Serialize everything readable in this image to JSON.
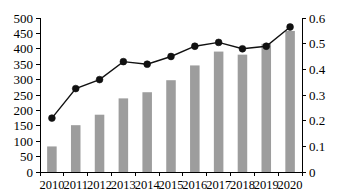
{
  "chart_data": {
    "type": "bar",
    "title": "",
    "subtitle": "",
    "xlabel": "",
    "ylabel": "",
    "y2label": "",
    "categories": [
      "2010",
      "2011",
      "2012",
      "2013",
      "2014",
      "2015",
      "2016",
      "2017",
      "2018",
      "2019",
      "2020"
    ],
    "series": [
      {
        "name": "bar-series",
        "render": "bar",
        "axis": "left",
        "color": "#9d9d9d",
        "values": [
          83,
          152,
          186,
          239,
          259,
          298,
          346,
          391,
          381,
          416,
          458
        ]
      },
      {
        "name": "line-series",
        "render": "line",
        "axis": "right",
        "color": "#111111",
        "marker": "circle",
        "values": [
          0.21,
          0.325,
          0.36,
          0.43,
          0.42,
          0.45,
          0.49,
          0.505,
          0.48,
          0.49,
          0.565
        ]
      }
    ],
    "ylim": [
      0,
      500
    ],
    "y2lim": [
      0,
      0.6
    ],
    "ytick_labels": [
      "0",
      "50",
      "100",
      "150",
      "200",
      "250",
      "300",
      "350",
      "400",
      "450",
      "500"
    ],
    "ytick_values": [
      0,
      50,
      100,
      150,
      200,
      250,
      300,
      350,
      400,
      450,
      500
    ],
    "y2tick_labels": [
      "0",
      "0.1",
      "0.2",
      "0.3",
      "0.4",
      "0.5",
      "0.6"
    ],
    "y2tick_values": [
      0,
      0.1,
      0.2,
      0.3,
      0.4,
      0.5,
      0.6
    ],
    "grid": false,
    "legend": "none",
    "legend_entries": []
  }
}
